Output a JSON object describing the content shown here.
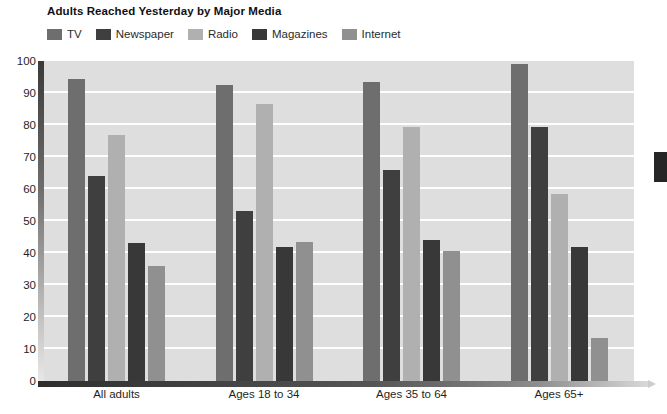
{
  "chart_data": {
    "type": "bar",
    "title": "Adults Reached Yesterday by Major Media",
    "xlabel": "",
    "ylabel": "",
    "ylim": [
      0,
      100
    ],
    "ytick_step": 10,
    "yticks": [
      100,
      90,
      80,
      70,
      60,
      50,
      40,
      30,
      20,
      10,
      0
    ],
    "grid": true,
    "legend_position": "top-left",
    "categories": [
      "All adults",
      "Ages 18 to 34",
      "Ages 35 to 64",
      "Ages 65+"
    ],
    "series": [
      {
        "name": "TV",
        "color": "#6e6e6e",
        "values": [
          94.5,
          92.5,
          93.5,
          99.0
        ]
      },
      {
        "name": "Newspaper",
        "color": "#3f3f3f",
        "values": [
          64.0,
          53.0,
          66.0,
          79.5
        ]
      },
      {
        "name": "Radio",
        "color": "#b0b0b0",
        "values": [
          77.0,
          86.5,
          79.5,
          58.5
        ]
      },
      {
        "name": "Magazines",
        "color": "#383838",
        "values": [
          43.0,
          42.0,
          44.0,
          42.0
        ]
      },
      {
        "name": "Internet",
        "color": "#909090",
        "values": [
          36.0,
          43.5,
          40.5,
          13.5
        ]
      }
    ]
  },
  "plot": {
    "background_color": "#dedede",
    "gridline_color": "#ffffff"
  }
}
